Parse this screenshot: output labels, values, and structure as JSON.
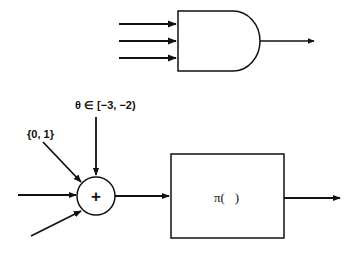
{
  "and_gate": {
    "input_count": 3,
    "symbol": "AND gate"
  },
  "neuron": {
    "sum_symbol": "+",
    "input_labels": {
      "binary_input": "{0, 1}",
      "threshold": "θ ∈ [−3, −2)"
    },
    "activation_label": "π(   )"
  },
  "colors": {
    "stroke": "#111111",
    "background": "#ffffff"
  }
}
